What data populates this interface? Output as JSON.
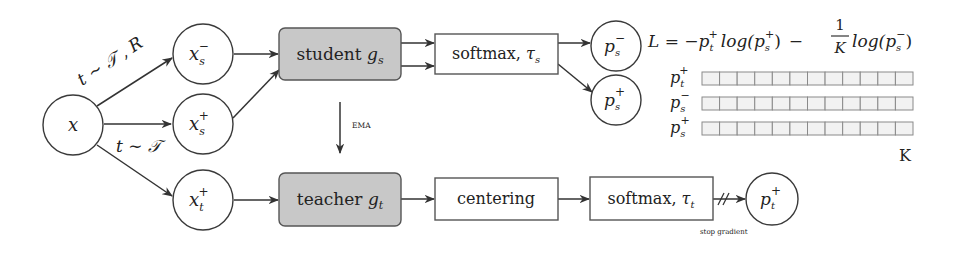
{
  "diagram": {
    "colors": {
      "model_box_fill": "#c8c8c8",
      "plain_box_fill": "#ffffff",
      "stroke": "#333333",
      "cell_fill": "#f2f2f2"
    },
    "nodes": {
      "input": {
        "base": "x",
        "sub": "",
        "sup": ""
      },
      "x_s_neg": {
        "base": "x",
        "sub": "s",
        "sup": "−"
      },
      "x_s_pos": {
        "base": "x",
        "sub": "s",
        "sup": "+"
      },
      "x_t_pos": {
        "base": "x",
        "sub": "t",
        "sup": "+"
      },
      "p_s_neg": {
        "base": "p",
        "sub": "s",
        "sup": "−"
      },
      "p_s_pos": {
        "base": "p",
        "sub": "s",
        "sup": "+"
      },
      "p_t_pos": {
        "base": "p",
        "sub": "t",
        "sup": "+"
      }
    },
    "boxes": {
      "student": {
        "text": "student ",
        "var": "g",
        "sub": "s"
      },
      "teacher": {
        "text": "teacher ",
        "var": "g",
        "sub": "t"
      },
      "softmax_student": {
        "text": "softmax, ",
        "var": "τ",
        "sub": "s"
      },
      "centering": {
        "text": "centering"
      },
      "softmax_teacher": {
        "text": "softmax, ",
        "var": "τ",
        "sub": "t"
      }
    },
    "edge_labels": {
      "aug_neg": "t ∼ 𝒯 , R",
      "aug_pos": "t ∼ 𝒯",
      "ema": "EMA",
      "stop_gradient": "stop gradient"
    },
    "loss": {
      "lhs": "L",
      "equals": " = −",
      "term1_p": "p",
      "term1_sub": "t",
      "term1_sup": "+",
      "log1_open": "log(",
      "log1_p": "p",
      "log1_sub": "s",
      "log1_sup": "+",
      "close": ")",
      "minus": "−",
      "frac_num": "1",
      "frac_den": "K",
      "log2_open": "log(",
      "log2_p": "p",
      "log2_sub": "s",
      "log2_sup": "−"
    },
    "distributions": {
      "num_cells": 12,
      "dimension_label": "K",
      "rows": [
        {
          "base": "p",
          "sub": "t",
          "sup": "+"
        },
        {
          "base": "p",
          "sub": "s",
          "sup": "−"
        },
        {
          "base": "p",
          "sub": "s",
          "sup": "+"
        }
      ]
    }
  }
}
